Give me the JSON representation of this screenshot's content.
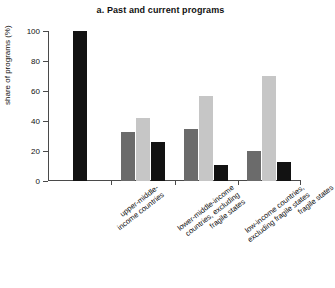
{
  "chart_data": {
    "type": "bar",
    "title": "a. Past and current programs",
    "xlabel": "",
    "ylabel": "share of programs (%)",
    "ylim": [
      0,
      100
    ],
    "yticks": [
      0,
      20,
      40,
      60,
      80,
      100
    ],
    "ytick_labels": [
      "0",
      "20",
      "40",
      "60",
      "80",
      "100"
    ],
    "grid": false,
    "legend": "none",
    "categories": [
      "upper-middle-income countries",
      "lower-middle-income countries, excluding fragile states",
      "low-income countries, excluding fragile states",
      "fragile states"
    ],
    "category_lines": [
      [
        "upper-middle-",
        "income countries"
      ],
      [
        "lower-middle-income",
        "countries, excluding",
        "fragile states"
      ],
      [
        "low-income countries,",
        "excluding fragile states"
      ],
      [
        "fragile states"
      ]
    ],
    "series": [
      {
        "name": "series-1",
        "color": "#6b6b6b",
        "values": [
          null,
          33,
          35,
          20
        ]
      },
      {
        "name": "series-2",
        "color": "#c6c6c6",
        "values": [
          null,
          42,
          57,
          70
        ]
      },
      {
        "name": "series-3",
        "color": "#121212",
        "values": [
          100,
          26,
          11,
          13
        ]
      }
    ]
  }
}
